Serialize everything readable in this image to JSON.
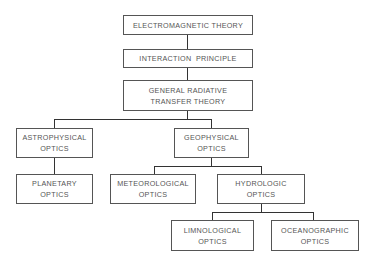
{
  "diagram": {
    "type": "hierarchy",
    "nodes": [
      {
        "id": "em",
        "lines": [
          "ELECTROMAGNETIC THEORY"
        ]
      },
      {
        "id": "ip",
        "lines": [
          "INTERACTION  PRINCIPLE"
        ]
      },
      {
        "id": "grt",
        "lines": [
          "GENERAL RADIATIVE",
          "TRANSFER THEORY"
        ]
      },
      {
        "id": "astro",
        "lines": [
          "ASTROPHYSICAL",
          "OPTICS"
        ]
      },
      {
        "id": "geo",
        "lines": [
          "GEOPHYSICAL",
          "OPTICS"
        ]
      },
      {
        "id": "planet",
        "lines": [
          "PLANETARY",
          "OPTICS"
        ]
      },
      {
        "id": "meteo",
        "lines": [
          "METEOROLOGICAL",
          "OPTICS"
        ]
      },
      {
        "id": "hydro",
        "lines": [
          "HYDROLOGIC",
          "OPTICS"
        ]
      },
      {
        "id": "limno",
        "lines": [
          "LIMNOLOGICAL",
          "OPTICS"
        ]
      },
      {
        "id": "ocean",
        "lines": [
          "OCEANOGRAPHIC",
          "OPTICS"
        ]
      }
    ],
    "edges": [
      [
        "em",
        "ip"
      ],
      [
        "ip",
        "grt"
      ],
      [
        "grt",
        "astro"
      ],
      [
        "grt",
        "geo"
      ],
      [
        "astro",
        "planet"
      ],
      [
        "geo",
        "meteo"
      ],
      [
        "geo",
        "hydro"
      ],
      [
        "hydro",
        "limno"
      ],
      [
        "hydro",
        "ocean"
      ]
    ]
  }
}
